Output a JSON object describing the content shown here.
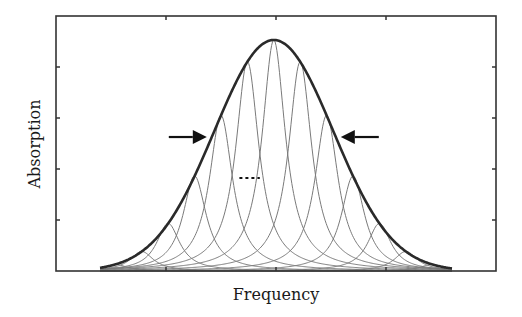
{
  "chart_data": {
    "type": "line",
    "title": "",
    "xlabel": "Frequency",
    "ylabel": "Absorption",
    "xlim": [
      0,
      100
    ],
    "ylim": [
      0,
      1.1
    ],
    "x_ticks": [
      25,
      50,
      75
    ],
    "y_ticks": [
      0.22,
      0.44,
      0.66,
      0.88
    ],
    "tick_labels_shown": false,
    "grid": false,
    "legend": "none",
    "envelope": {
      "name": "inhomogeneous envelope (Gaussian)",
      "center": 49.5,
      "sigma": 13.5,
      "peak": 1.0
    },
    "components": {
      "name": "homogeneous components (Lorentzian)",
      "centers": [
        13.5,
        19.5,
        25.5,
        31.5,
        37.5,
        43.5,
        49.5,
        55.5,
        61.5,
        67.5,
        73.5,
        79.5,
        85.5
      ],
      "half_width": 3.2
    },
    "annotations": [
      {
        "type": "arrow",
        "direction": "right",
        "target": "left half-maximum point of envelope"
      },
      {
        "type": "arrow",
        "direction": "left",
        "target": "right half-maximum point of envelope"
      },
      {
        "type": "ellipsis",
        "text": "…",
        "between_components": [
          43.5,
          49.5
        ]
      }
    ]
  }
}
